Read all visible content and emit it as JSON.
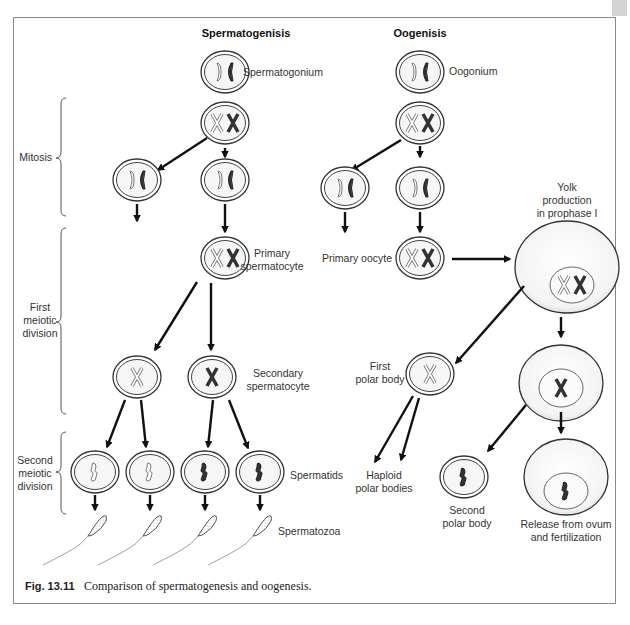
{
  "figure": {
    "caption_number": "Fig. 13.11",
    "caption_text": "Comparison of spermatogenesis and oogenesis."
  },
  "columns": {
    "spermatogenesis": {
      "header": "Spermatogenisis",
      "labels": {
        "spermatogonium": "Spermatogonium",
        "primary_line1": "Primary",
        "primary_line2": "spermatocyte",
        "secondary_line1": "Secondary",
        "secondary_line2": "spermatocyte",
        "spermatids": "Spermatids",
        "spermatozoa": "Spermatozoa"
      }
    },
    "oogenesis": {
      "header": "Oogenisis",
      "labels": {
        "oogonium": "Oogonium",
        "yolk_line1": "Yolk",
        "yolk_line2": "production",
        "yolk_line3": "in prophase I",
        "primary_oocyte": "Primary oocyte",
        "first_polar_line1": "First",
        "first_polar_line2": "polar body",
        "haploid_line1": "Haploid",
        "haploid_line2": "polar bodies",
        "second_polar_line1": "Second",
        "second_polar_line2": "polar body",
        "release_line1": "Release from ovum",
        "release_line2": "and fertilization"
      }
    }
  },
  "stages": {
    "mitosis": "Mitosis",
    "first_meiotic_line1": "First",
    "first_meiotic_line2": "meiotic",
    "first_meiotic_line3": "division",
    "second_meiotic_line1": "Second",
    "second_meiotic_line2": "meiotic",
    "second_meiotic_line3": "division"
  }
}
